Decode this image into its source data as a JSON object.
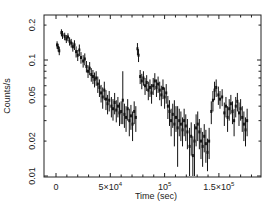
{
  "chart_data": {
    "type": "scatter",
    "subtype": "light-curve-with-error-bars",
    "title": "",
    "xlabel": "Time (sec)",
    "ylabel": "Counts/s",
    "xscale": "linear",
    "yscale": "log",
    "xlim": [
      -11000,
      190000
    ],
    "ylim": [
      0.01,
      0.22
    ],
    "grid": false,
    "legend": null,
    "x_ticks": [
      {
        "value": 0,
        "label": "0"
      },
      {
        "value": 50000,
        "label": "5×10⁴",
        "base": "5×10",
        "exp": "4"
      },
      {
        "value": 100000,
        "label": "10⁵",
        "base": "10",
        "exp": "5"
      },
      {
        "value": 150000,
        "label": "1.5×10⁵",
        "base": "1.5×10",
        "exp": "5"
      }
    ],
    "y_ticks": [
      {
        "value": 0.01,
        "label": "0.01"
      },
      {
        "value": 0.02,
        "label": "0.02"
      },
      {
        "value": 0.05,
        "label": "0.05"
      },
      {
        "value": 0.1,
        "label": "0.1"
      },
      {
        "value": 0.2,
        "label": "0.2"
      }
    ],
    "series": [
      {
        "name": "light curve",
        "color": "#111111",
        "points": [
          [
            1000,
            0.135,
            0.125,
            0.145
          ],
          [
            2000,
            0.128,
            0.118,
            0.138
          ],
          [
            3000,
            0.12,
            0.11,
            0.13
          ],
          [
            5000,
            0.172,
            0.16,
            0.184
          ],
          [
            6000,
            0.165,
            0.152,
            0.178
          ],
          [
            8000,
            0.16,
            0.148,
            0.172
          ],
          [
            9500,
            0.152,
            0.14,
            0.164
          ],
          [
            11000,
            0.158,
            0.145,
            0.17
          ],
          [
            12500,
            0.145,
            0.133,
            0.157
          ],
          [
            14000,
            0.14,
            0.128,
            0.152
          ],
          [
            15500,
            0.13,
            0.118,
            0.142
          ],
          [
            17000,
            0.135,
            0.122,
            0.148
          ],
          [
            18500,
            0.118,
            0.105,
            0.131
          ],
          [
            20000,
            0.11,
            0.098,
            0.122
          ],
          [
            21500,
            0.122,
            0.108,
            0.136
          ],
          [
            23000,
            0.105,
            0.093,
            0.117
          ],
          [
            25000,
            0.098,
            0.086,
            0.11
          ],
          [
            26500,
            0.102,
            0.09,
            0.114
          ],
          [
            28000,
            0.088,
            0.078,
            0.098
          ],
          [
            29500,
            0.08,
            0.07,
            0.09
          ],
          [
            31000,
            0.085,
            0.074,
            0.096
          ],
          [
            32500,
            0.075,
            0.065,
            0.085
          ],
          [
            34000,
            0.072,
            0.062,
            0.082
          ],
          [
            35500,
            0.068,
            0.058,
            0.078
          ],
          [
            37000,
            0.07,
            0.06,
            0.08
          ],
          [
            38500,
            0.062,
            0.052,
            0.072
          ],
          [
            40000,
            0.058,
            0.048,
            0.068
          ],
          [
            41500,
            0.052,
            0.043,
            0.061
          ],
          [
            43000,
            0.048,
            0.038,
            0.058
          ],
          [
            44500,
            0.055,
            0.045,
            0.065
          ],
          [
            46000,
            0.046,
            0.037,
            0.055
          ],
          [
            47500,
            0.042,
            0.034,
            0.05
          ],
          [
            49000,
            0.045,
            0.036,
            0.054
          ],
          [
            51000,
            0.04,
            0.032,
            0.048
          ],
          [
            52500,
            0.038,
            0.03,
            0.046
          ],
          [
            54000,
            0.043,
            0.034,
            0.052
          ],
          [
            55500,
            0.037,
            0.029,
            0.045
          ],
          [
            57000,
            0.04,
            0.032,
            0.048
          ],
          [
            58500,
            0.035,
            0.027,
            0.043
          ],
          [
            60000,
            0.036,
            0.028,
            0.044
          ],
          [
            61500,
            0.045,
            0.028,
            0.08
          ],
          [
            63000,
            0.034,
            0.026,
            0.042
          ],
          [
            64500,
            0.032,
            0.024,
            0.04
          ],
          [
            66000,
            0.038,
            0.03,
            0.046
          ],
          [
            67500,
            0.03,
            0.022,
            0.038
          ],
          [
            69000,
            0.033,
            0.025,
            0.041
          ],
          [
            70500,
            0.028,
            0.02,
            0.036
          ],
          [
            72000,
            0.036,
            0.028,
            0.044
          ],
          [
            73500,
            0.032,
            0.024,
            0.04
          ],
          [
            75000,
            0.125,
            0.11,
            0.14
          ],
          [
            76000,
            0.11,
            0.096,
            0.124
          ],
          [
            77500,
            0.072,
            0.062,
            0.082
          ],
          [
            79000,
            0.066,
            0.056,
            0.076
          ],
          [
            80500,
            0.07,
            0.06,
            0.08
          ],
          [
            82000,
            0.06,
            0.05,
            0.07
          ],
          [
            83500,
            0.064,
            0.054,
            0.074
          ],
          [
            85000,
            0.055,
            0.045,
            0.065
          ],
          [
            86500,
            0.058,
            0.048,
            0.068
          ],
          [
            88000,
            0.052,
            0.042,
            0.062
          ],
          [
            89500,
            0.06,
            0.05,
            0.07
          ],
          [
            91000,
            0.066,
            0.055,
            0.077
          ],
          [
            92500,
            0.058,
            0.048,
            0.068
          ],
          [
            94000,
            0.062,
            0.052,
            0.072
          ],
          [
            95500,
            0.055,
            0.045,
            0.065
          ],
          [
            97000,
            0.05,
            0.04,
            0.06
          ],
          [
            98500,
            0.057,
            0.046,
            0.068
          ],
          [
            100000,
            0.048,
            0.038,
            0.058
          ],
          [
            101500,
            0.052,
            0.042,
            0.062
          ],
          [
            103000,
            0.04,
            0.031,
            0.049
          ],
          [
            104500,
            0.036,
            0.027,
            0.045
          ],
          [
            106000,
            0.03,
            0.022,
            0.038
          ],
          [
            107500,
            0.034,
            0.026,
            0.042
          ],
          [
            109000,
            0.028,
            0.018,
            0.045
          ],
          [
            110500,
            0.032,
            0.024,
            0.04
          ],
          [
            112000,
            0.026,
            0.012,
            0.04
          ],
          [
            113500,
            0.03,
            0.022,
            0.038
          ],
          [
            115000,
            0.028,
            0.02,
            0.036
          ],
          [
            116500,
            0.025,
            0.018,
            0.032
          ],
          [
            118000,
            0.03,
            0.022,
            0.038
          ],
          [
            119500,
            0.027,
            0.02,
            0.034
          ],
          [
            121000,
            0.024,
            0.017,
            0.031
          ],
          [
            123000,
            0.018,
            0.01,
            0.026
          ],
          [
            124500,
            0.022,
            0.015,
            0.029
          ],
          [
            126000,
            0.015,
            0.01,
            0.022
          ],
          [
            127500,
            0.02,
            0.01,
            0.028
          ],
          [
            129000,
            0.026,
            0.018,
            0.034
          ],
          [
            130500,
            0.028,
            0.02,
            0.036
          ],
          [
            132000,
            0.024,
            0.017,
            0.031
          ],
          [
            133500,
            0.02,
            0.014,
            0.026
          ],
          [
            135000,
            0.018,
            0.012,
            0.024
          ],
          [
            136500,
            0.022,
            0.016,
            0.028
          ],
          [
            138000,
            0.019,
            0.013,
            0.025
          ],
          [
            139500,
            0.016,
            0.011,
            0.021
          ],
          [
            141000,
            0.02,
            0.014,
            0.026
          ],
          [
            143000,
            0.036,
            0.028,
            0.044
          ],
          [
            144500,
            0.045,
            0.036,
            0.054
          ],
          [
            146000,
            0.055,
            0.045,
            0.065
          ],
          [
            147500,
            0.058,
            0.048,
            0.068
          ],
          [
            149500,
            0.05,
            0.041,
            0.059
          ],
          [
            151000,
            0.046,
            0.038,
            0.054
          ],
          [
            153000,
            0.048,
            0.04,
            0.056
          ],
          [
            155000,
            0.035,
            0.027,
            0.043
          ],
          [
            156500,
            0.04,
            0.032,
            0.048
          ],
          [
            158000,
            0.032,
            0.024,
            0.04
          ],
          [
            159500,
            0.038,
            0.03,
            0.046
          ],
          [
            161000,
            0.042,
            0.034,
            0.05
          ],
          [
            162500,
            0.036,
            0.028,
            0.044
          ],
          [
            164000,
            0.03,
            0.022,
            0.038
          ],
          [
            165500,
            0.04,
            0.032,
            0.048
          ],
          [
            167000,
            0.044,
            0.036,
            0.052
          ],
          [
            168500,
            0.035,
            0.027,
            0.043
          ],
          [
            170000,
            0.038,
            0.03,
            0.046
          ],
          [
            171500,
            0.032,
            0.024,
            0.04
          ],
          [
            173000,
            0.028,
            0.02,
            0.036
          ],
          [
            174500,
            0.025,
            0.018,
            0.032
          ],
          [
            176000,
            0.03,
            0.022,
            0.038
          ]
        ]
      }
    ]
  }
}
